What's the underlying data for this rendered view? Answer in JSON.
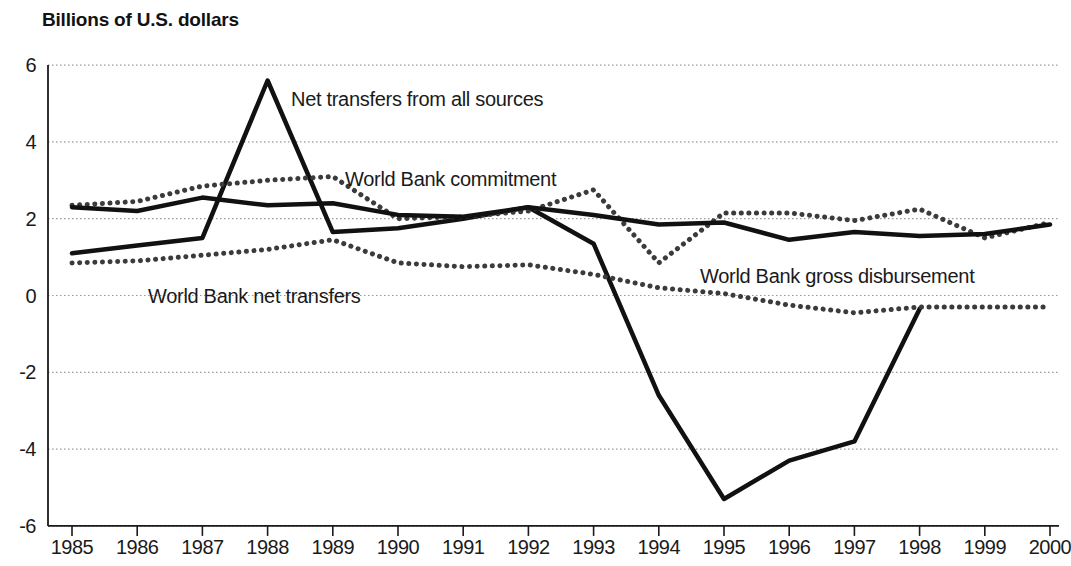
{
  "chart_data": {
    "type": "line",
    "title": "Billions of U.S. dollars",
    "xlabel": "",
    "ylabel": "Billions of U.S. dollars",
    "x": [
      1985,
      1986,
      1987,
      1988,
      1989,
      1990,
      1991,
      1992,
      1993,
      1994,
      1995,
      1996,
      1997,
      1998,
      1999,
      2000
    ],
    "categories": [
      "1985",
      "1986",
      "1987",
      "1988",
      "1989",
      "1990",
      "1991",
      "1992",
      "1993",
      "1994",
      "1995",
      "1996",
      "1997",
      "1998",
      "1999",
      "2000"
    ],
    "xlim": [
      1985,
      2000
    ],
    "ylim": [
      -6,
      6
    ],
    "yticks": [
      6,
      4,
      2,
      0,
      -2,
      -4,
      -6
    ],
    "ytick_labels": [
      "6",
      "4",
      "2",
      "0",
      "-2",
      "-4",
      "-6"
    ],
    "grid": true,
    "grid_style": "dotted horizontal",
    "legend": "inline annotations",
    "series": [
      {
        "name": "Net transfers from all sources",
        "style": "solid",
        "color": "#111111",
        "width": 4.5,
        "values": [
          1.1,
          1.3,
          1.5,
          5.6,
          1.65,
          1.75,
          2.0,
          2.3,
          1.35,
          -2.6,
          -5.3,
          -4.3,
          -3.8,
          -0.35,
          null,
          null
        ]
      },
      {
        "name": "World Bank commitment",
        "style": "dotted",
        "color": "#3b3b3b",
        "width": 5,
        "values": [
          2.35,
          2.45,
          2.85,
          3.0,
          3.1,
          2.0,
          2.05,
          2.2,
          2.75,
          0.85,
          2.15,
          2.15,
          1.95,
          2.25,
          1.5,
          1.9
        ]
      },
      {
        "name": "World Bank gross disbursement",
        "style": "solid",
        "color": "#111111",
        "width": 4.5,
        "values": [
          2.3,
          2.2,
          2.55,
          2.35,
          2.4,
          2.1,
          2.05,
          2.3,
          2.1,
          1.85,
          1.9,
          1.45,
          1.65,
          1.55,
          1.6,
          1.85
        ]
      },
      {
        "name": "World Bank net transfers",
        "style": "dotted",
        "color": "#3b3b3b",
        "width": 5,
        "values": [
          0.85,
          0.9,
          1.05,
          1.2,
          1.45,
          0.85,
          0.75,
          0.8,
          0.55,
          0.2,
          0.05,
          -0.25,
          -0.45,
          -0.3,
          -0.3,
          -0.3
        ]
      }
    ],
    "annotations": [
      {
        "text": "Net transfers from all sources",
        "x_px": 291,
        "y_px": 88
      },
      {
        "text": "World Bank commitment",
        "x_px": 345,
        "y_px": 168
      },
      {
        "text": "World Bank net transfers",
        "x_px": 148,
        "y_px": 285
      },
      {
        "text": "World Bank gross disbursement",
        "x_px": 700,
        "y_px": 265
      }
    ]
  },
  "axes": {
    "y_tick_labels": [
      "6",
      "4",
      "2",
      "0",
      "-2",
      "-4",
      "-6"
    ],
    "x_tick_labels": [
      "1985",
      "1986",
      "1987",
      "1988",
      "1989",
      "1990",
      "1991",
      "1992",
      "1993",
      "1994",
      "1995",
      "1996",
      "1997",
      "1998",
      "1999",
      "2000"
    ]
  },
  "colors": {
    "axis": "#1a1a1a",
    "grid": "#9a9a9a",
    "solid_series": "#111111",
    "dotted_series": "#3b3b3b",
    "background": "#ffffff"
  }
}
